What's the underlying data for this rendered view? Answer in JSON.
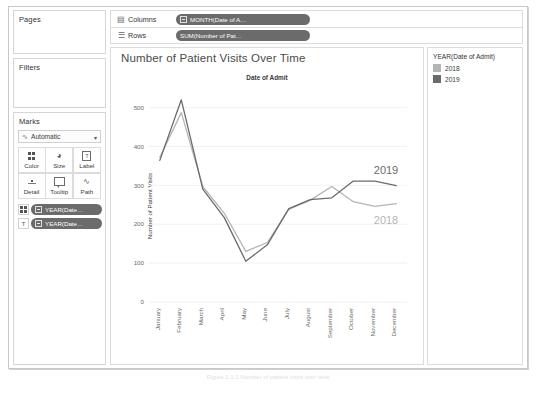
{
  "shelves": {
    "pages": {
      "label": "Pages"
    },
    "filters": {
      "label": "Filters"
    },
    "marks": {
      "label": "Marks",
      "type": "Automatic",
      "type_icon": "line-mark-icon",
      "caret": "▾",
      "buttons": [
        {
          "label": "Color",
          "icon": "color-dots-icon"
        },
        {
          "label": "Size",
          "icon": "size-icon"
        },
        {
          "label": "Label",
          "icon": "label-icon"
        },
        {
          "label": "Detail",
          "icon": "detail-icon"
        },
        {
          "label": "Tooltip",
          "icon": "tooltip-icon"
        },
        {
          "label": "Path",
          "icon": "path-icon"
        }
      ],
      "pills": [
        {
          "slot_icon": "color-dots-icon",
          "text": "YEAR(Date…"
        },
        {
          "slot_icon": "label-icon",
          "text": "YEAR(Date…"
        }
      ]
    },
    "columns": {
      "label": "Columns",
      "icon": "columns-icon",
      "pill": "MONTH(Date of A…"
    },
    "rows": {
      "label": "Rows",
      "icon": "rows-icon",
      "pill": "SUM(Number of Pat…"
    }
  },
  "legend": {
    "title": "YEAR(Date of Admit)",
    "items": [
      {
        "label": "2018",
        "color": "#b5b5b5"
      },
      {
        "label": "2019",
        "color": "#6b6b6b"
      }
    ]
  },
  "caption": "Figure 1.1.1  Number of patient visits over time",
  "chart_data": {
    "type": "line",
    "title": "Number of Patient Visits Over Time",
    "subtitle": "Date of Admit",
    "xlabel": "",
    "ylabel": "Number of Patient Visits",
    "ylim": [
      0,
      540
    ],
    "yticks": [
      0,
      100,
      200,
      300,
      400,
      500
    ],
    "grid": true,
    "legend_position": "right",
    "categories": [
      "January",
      "February",
      "March",
      "April",
      "May",
      "June",
      "July",
      "August",
      "September",
      "October",
      "November",
      "December"
    ],
    "series": [
      {
        "name": "2018",
        "color": "#b5b5b5",
        "end_label": "2018",
        "values": [
          372,
          487,
          297,
          228,
          130,
          153,
          238,
          262,
          297,
          258,
          246,
          253
        ]
      },
      {
        "name": "2019",
        "color": "#6b6b6b",
        "end_label": "2019",
        "values": [
          364,
          520,
          290,
          217,
          105,
          147,
          240,
          263,
          268,
          311,
          311,
          299
        ]
      }
    ]
  }
}
